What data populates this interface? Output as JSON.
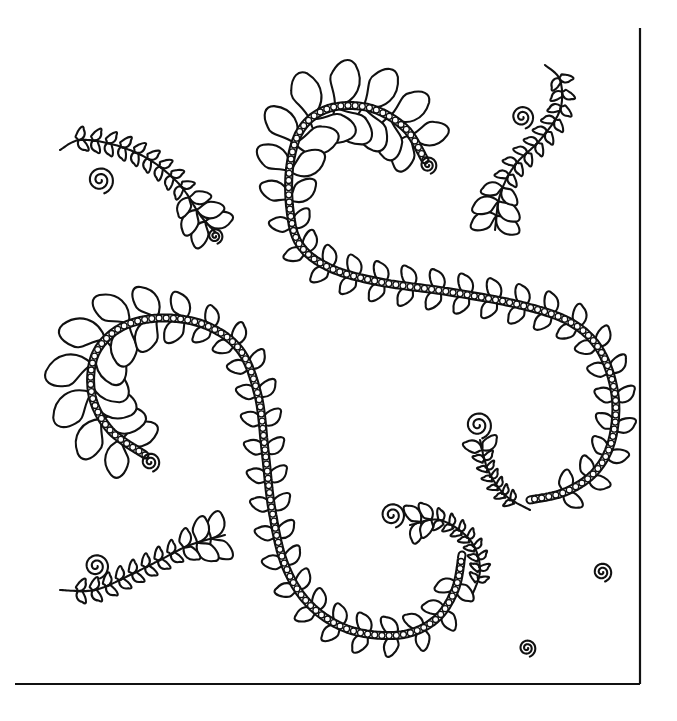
{
  "artwork": {
    "title": "Feather quilting motif",
    "description": "Black line-art feather quilting pattern with two pearl-beaded spine plumes, small free feathers and spirals, framed by an L-shaped border on the right and bottom.",
    "stroke_color": "#111111",
    "background_color": "#ffffff",
    "border": {
      "right": {
        "x": 640,
        "y1": 28,
        "y2": 684
      },
      "bottom": {
        "y": 684,
        "x1": 15,
        "x2": 640
      }
    },
    "plumes": [
      {
        "name": "upper-s-plume",
        "spine": [
          [
            425,
            160
          ],
          [
            405,
            128
          ],
          [
            370,
            108
          ],
          [
            330,
            108
          ],
          [
            302,
            128
          ],
          [
            290,
            165
          ],
          [
            290,
            210
          ],
          [
            300,
            245
          ],
          [
            330,
            268
          ],
          [
            380,
            282
          ],
          [
            450,
            292
          ],
          [
            520,
            305
          ],
          [
            570,
            322
          ],
          [
            600,
            350
          ],
          [
            615,
            395
          ],
          [
            612,
            440
          ],
          [
            595,
            472
          ],
          [
            565,
            492
          ],
          [
            530,
            500
          ]
        ],
        "beaded": true,
        "feather_size": 30
      },
      {
        "name": "lower-j-plume",
        "spine": [
          [
            145,
            455
          ],
          [
            110,
            430
          ],
          [
            92,
            395
          ],
          [
            95,
            355
          ],
          [
            120,
            328
          ],
          [
            160,
            318
          ],
          [
            205,
            325
          ],
          [
            240,
            350
          ],
          [
            258,
            395
          ],
          [
            265,
            450
          ],
          [
            272,
            510
          ],
          [
            285,
            565
          ],
          [
            310,
            605
          ],
          [
            350,
            630
          ],
          [
            400,
            635
          ],
          [
            435,
            620
          ],
          [
            455,
            590
          ],
          [
            462,
            555
          ]
        ],
        "beaded": true,
        "feather_size": 30
      }
    ],
    "small_feathers": [
      {
        "name": "top-left-feather",
        "spine": [
          [
            215,
            232
          ],
          [
            200,
            215
          ],
          [
            180,
            185
          ],
          [
            150,
            160
          ],
          [
            115,
            145
          ],
          [
            80,
            140
          ],
          [
            60,
            150
          ]
        ],
        "size": 17
      },
      {
        "name": "top-right-feather",
        "spine": [
          [
            495,
            230
          ],
          [
            500,
            195
          ],
          [
            515,
            165
          ],
          [
            540,
            140
          ],
          [
            560,
            110
          ],
          [
            560,
            80
          ],
          [
            545,
            65
          ]
        ],
        "size": 17
      },
      {
        "name": "right-mid-feather",
        "spine": [
          [
            480,
            440
          ],
          [
            488,
            470
          ],
          [
            505,
            495
          ],
          [
            530,
            510
          ]
        ],
        "size": 12
      },
      {
        "name": "bottom-left-feather",
        "spine": [
          [
            225,
            535
          ],
          [
            190,
            545
          ],
          [
            160,
            560
          ],
          [
            130,
            575
          ],
          [
            95,
            590
          ],
          [
            60,
            590
          ]
        ],
        "size": 17
      },
      {
        "name": "bottom-center-feather",
        "spine": [
          [
            410,
            525
          ],
          [
            440,
            520
          ],
          [
            470,
            540
          ],
          [
            480,
            570
          ],
          [
            470,
            600
          ]
        ],
        "size": 13
      }
    ],
    "spirals": [
      {
        "name": "spiral-top-left",
        "cx": 100,
        "cy": 180,
        "r": 14
      },
      {
        "name": "spiral-top-left-tail",
        "cx": 215,
        "cy": 236,
        "r": 8
      },
      {
        "name": "spiral-upper-plume-tip",
        "cx": 428,
        "cy": 165,
        "r": 9
      },
      {
        "name": "spiral-top-right",
        "cx": 522,
        "cy": 117,
        "r": 12
      },
      {
        "name": "spiral-right-mid",
        "cx": 478,
        "cy": 425,
        "r": 14
      },
      {
        "name": "spiral-left-plume-tip",
        "cx": 150,
        "cy": 462,
        "r": 10
      },
      {
        "name": "spiral-bottom-left",
        "cx": 96,
        "cy": 566,
        "r": 13
      },
      {
        "name": "spiral-bottom-center",
        "cx": 392,
        "cy": 515,
        "r": 13
      },
      {
        "name": "spiral-right-lone",
        "cx": 602,
        "cy": 572,
        "r": 10
      },
      {
        "name": "spiral-bottom-lone",
        "cx": 527,
        "cy": 648,
        "r": 9
      }
    ]
  }
}
